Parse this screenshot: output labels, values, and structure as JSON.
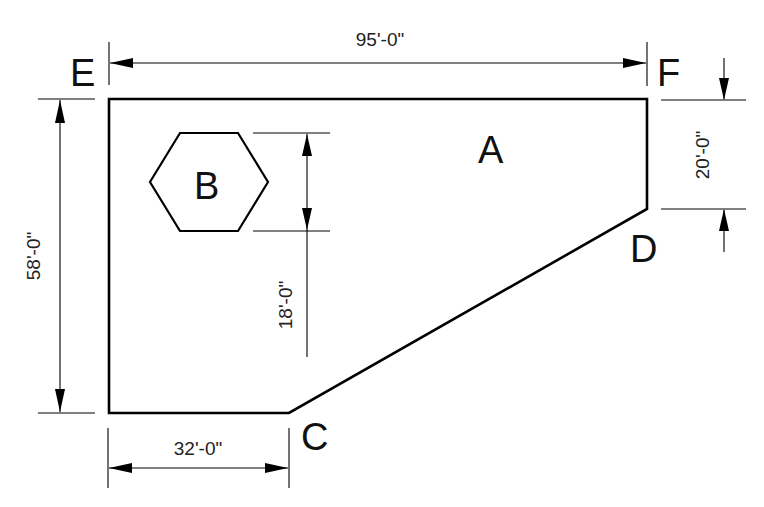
{
  "diagram": {
    "type": "technical-drawing",
    "regions": [
      {
        "id": "A",
        "label": "A",
        "shape": "polygon"
      },
      {
        "id": "B",
        "label": "B",
        "shape": "hexagon"
      }
    ],
    "vertices": [
      {
        "id": "E",
        "label": "E"
      },
      {
        "id": "F",
        "label": "F"
      },
      {
        "id": "D",
        "label": "D"
      },
      {
        "id": "C",
        "label": "C"
      }
    ],
    "dimensions": {
      "top_width": "95'-0\"",
      "left_height": "58'-0\"",
      "right_segment": "20'-0\"",
      "bottom_width": "32'-0\"",
      "hexagon_offset": "18'-0\""
    }
  }
}
